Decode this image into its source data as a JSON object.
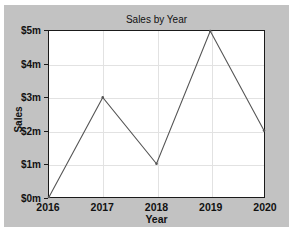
{
  "chart_data": {
    "type": "line",
    "title": "Sales by Year",
    "xlabel": "Year",
    "ylabel": "Sales",
    "categories": [
      "2016",
      "2017",
      "2018",
      "2019",
      "2020"
    ],
    "x": [
      2016,
      2017,
      2018,
      2019,
      2020
    ],
    "values": [
      0,
      3,
      1,
      5,
      2
    ],
    "series": [
      {
        "name": "Sales",
        "values": [
          0,
          3,
          1,
          5,
          2
        ]
      }
    ],
    "xtick_labels": [
      "2016",
      "2017",
      "2018",
      "2019",
      "2020"
    ],
    "ytick_values": [
      0,
      1,
      2,
      3,
      4,
      5
    ],
    "ytick_labels": [
      "$0m",
      "$1m",
      "$2m",
      "$3m",
      "$4m",
      "$5m"
    ],
    "xlim": [
      2016,
      2020
    ],
    "ylim": [
      0,
      5
    ],
    "grid": true,
    "legend": false,
    "value_unit": "$m",
    "colors": {
      "figure_background": "#c2c2c2",
      "plot_background": "#ffffff",
      "axis": "#1a1a1a",
      "gridline": "#e2e2e2",
      "line": "#555555",
      "text": "#111111"
    }
  }
}
